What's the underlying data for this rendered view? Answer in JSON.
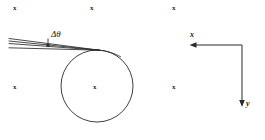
{
  "figure": {
    "background_color": "#ffffff",
    "stroke_color": "#2a2a2a",
    "text_color": "#1b1b1b",
    "width": 265,
    "height": 140
  },
  "annotations": {
    "delta_theta_label": "Δθ"
  },
  "axes": {
    "x_label": "x",
    "y_label": "y",
    "corner_x": 242,
    "corner_y": 45,
    "x_arrow_tip_x": 190,
    "y_arrow_tip_y": 107,
    "x_direction": "left",
    "y_direction": "down"
  },
  "circle": {
    "center_x": 97,
    "center_y": 86,
    "radius": 36
  },
  "rays": [
    {
      "x1": 9,
      "y1": 39,
      "x2": 99,
      "y2": 50
    },
    {
      "x1": 9,
      "y1": 44,
      "x2": 99,
      "y2": 50
    },
    {
      "x1": 9,
      "y1": 48,
      "x2": 99,
      "y2": 50
    },
    {
      "x1": 11,
      "y1": 41,
      "x2": 99,
      "y2": 50
    }
  ],
  "tick_marks": [
    {
      "label": "x",
      "x": 13,
      "y": 5
    },
    {
      "label": "x",
      "x": 90,
      "y": 5
    },
    {
      "label": "x",
      "x": 172,
      "y": 5
    },
    {
      "label": "x",
      "x": 13,
      "y": 84
    },
    {
      "label": "x",
      "x": 93,
      "y": 84
    },
    {
      "label": "x",
      "x": 172,
      "y": 84
    }
  ]
}
